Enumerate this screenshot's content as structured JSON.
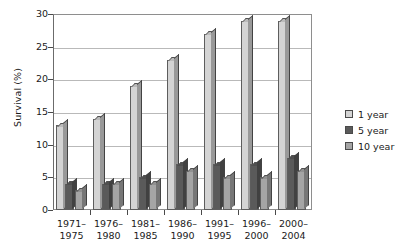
{
  "chart_data": {
    "type": "bar",
    "title": "",
    "subtitle": "",
    "xlabel": "",
    "ylabel": "Survival (%)",
    "ylim": [
      0,
      30
    ],
    "ytick_values": [
      0,
      5,
      10,
      15,
      20,
      25,
      30
    ],
    "ytick_labels": [
      "0",
      "5",
      "10",
      "15",
      "20",
      "25",
      "30"
    ],
    "grid": true,
    "legend_position": "right",
    "categories": [
      "1971–1975",
      "1976–1980",
      "1981–1985",
      "1986–1990",
      "1991–1995",
      "1996–2000",
      "2000–2004"
    ],
    "category_lines": [
      [
        "1971–",
        "1975"
      ],
      [
        "1976–",
        "1980"
      ],
      [
        "1981–",
        "1985"
      ],
      [
        "1986–",
        "1990"
      ],
      [
        "1991–",
        "1995"
      ],
      [
        "1996–",
        "2000"
      ],
      [
        "2000–",
        "2004"
      ]
    ],
    "series": [
      {
        "name": "1 year",
        "color": "#d4d4d4",
        "values": [
          13,
          14,
          19,
          23,
          27,
          29,
          29
        ]
      },
      {
        "name": "5 year",
        "color": "#5a5a5a",
        "values": [
          4,
          4,
          5,
          7,
          7,
          7,
          8
        ]
      },
      {
        "name": "10 year",
        "color": "#a5a5a5",
        "values": [
          3,
          4,
          4,
          6,
          5,
          5,
          6
        ]
      }
    ]
  },
  "legend": {
    "items": [
      {
        "label": "1 year",
        "color": "#d4d4d4"
      },
      {
        "label": "5 year",
        "color": "#5a5a5a"
      },
      {
        "label": "10 year",
        "color": "#a5a5a5"
      }
    ]
  }
}
